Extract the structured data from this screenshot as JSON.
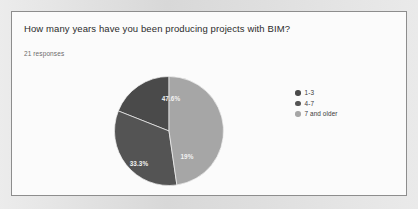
{
  "card": {
    "question": "How many years have you been producing projects with BIM?",
    "response_count": "21 responses"
  },
  "legend": {
    "items": [
      {
        "label": "1-3",
        "color": "#4a4a4a"
      },
      {
        "label": "4-7",
        "color": "#545454"
      },
      {
        "label": "7 and older",
        "color": "#a6a6a6"
      }
    ]
  },
  "chart_data": {
    "type": "pie",
    "title": "How many years have you been producing projects with BIM?",
    "subtitle": "21 responses",
    "categories": [
      "1-3",
      "4-7",
      "7 and older"
    ],
    "values": [
      19,
      33.3,
      47.6
    ],
    "data_labels": [
      "19%",
      "33.3%",
      "47.6%"
    ],
    "colors": [
      "#4a4a4a",
      "#545454",
      "#a6a6a6"
    ],
    "legend_position": "right",
    "grid": false,
    "total_responses": 21,
    "slices": [
      {
        "name": "1-3",
        "percent": 19,
        "label": "19%",
        "color": "#4a4a4a",
        "start_deg": 90,
        "end_deg": 158.4,
        "label_x": 73,
        "label_y": 81
      },
      {
        "name": "4-7",
        "percent": 33.3,
        "label": "33.3%",
        "color": "#545454",
        "start_deg": 158.4,
        "end_deg": 278.3,
        "label_x": 25,
        "label_y": 88
      },
      {
        "name": "7 and older",
        "percent": 47.6,
        "label": "47.6%",
        "color": "#a6a6a6",
        "start_deg": 278.3,
        "end_deg": 450,
        "label_x": 57,
        "label_y": 23
      }
    ]
  }
}
